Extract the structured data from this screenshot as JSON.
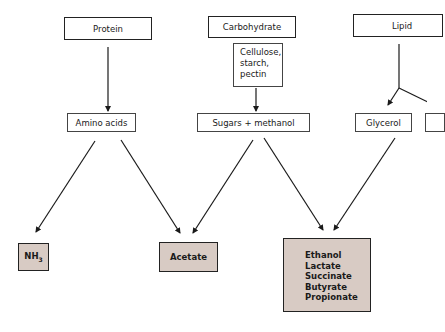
{
  "diagram": {
    "sources": {
      "protein": "Protein",
      "carbohydrate": "Carbohydrate",
      "lipid": "Lipid"
    },
    "carbohydrate_detail": [
      "Cellulose,",
      "starch,",
      "pectin"
    ],
    "intermediates": {
      "amino_acids": "Amino acids",
      "sugars_methanol": "Sugars + methanol",
      "glycerol": "Glycerol"
    },
    "products": {
      "nh3_base": "NH",
      "nh3_sub": "3",
      "acetate": "Acetate",
      "fermentation_products": [
        "Ethanol",
        "Lactate",
        "Succinate",
        "Butyrate",
        "Propionate"
      ]
    },
    "colors": {
      "product_fill": "#d8cbc4",
      "line": "#222222"
    },
    "edges": [
      {
        "from": "Protein",
        "to": "Amino acids"
      },
      {
        "from": "Carbohydrate (Cellulose, starch, pectin)",
        "to": "Sugars + methanol"
      },
      {
        "from": "Lipid",
        "to": "Glycerol"
      },
      {
        "from": "Lipid",
        "to": "(off-screen right)"
      },
      {
        "from": "Amino acids",
        "to": "NH3"
      },
      {
        "from": "Amino acids",
        "to": "Acetate"
      },
      {
        "from": "Sugars + methanol",
        "to": "Acetate"
      },
      {
        "from": "Sugars + methanol",
        "to": "Ethanol/Lactate/Succinate/Butyrate/Propionate"
      },
      {
        "from": "Glycerol",
        "to": "Ethanol/Lactate/Succinate/Butyrate/Propionate"
      }
    ]
  }
}
